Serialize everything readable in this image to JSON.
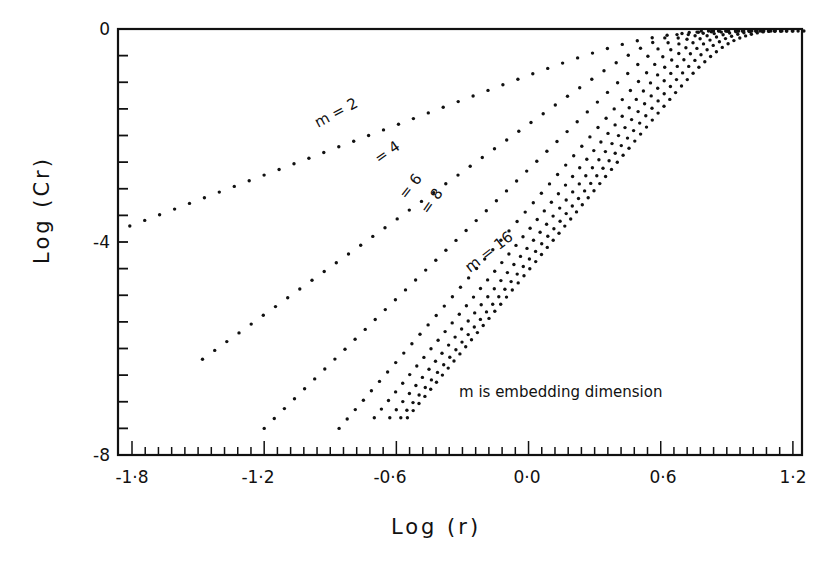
{
  "chart_data": {
    "type": "scatter",
    "title": "",
    "xlabel": "Log (r)",
    "ylabel": "Log (Cr)",
    "xlim": [
      -1.87,
      1.25
    ],
    "ylim": [
      -8,
      0
    ],
    "x_ticks": [
      "-1·8",
      "-1·2",
      "-0·6",
      "0·0",
      "0·6",
      "1·2"
    ],
    "x_tick_values": [
      -1.8,
      -1.2,
      -0.6,
      0.0,
      0.6,
      1.2
    ],
    "y_ticks": [
      "0",
      "-4",
      "-8"
    ],
    "y_tick_values": [
      0,
      -4,
      -8
    ],
    "grid": false,
    "legend": null,
    "annotation": "m is embedding dimension",
    "series": [
      {
        "name": "m = 2",
        "label": "m = 2",
        "x_start": -1.81,
        "y_start": -3.7,
        "x_end": 0.55,
        "y_end": 0.0,
        "bend": 0.25
      },
      {
        "name": "m = 4",
        "label": "= 4",
        "x_start": -1.48,
        "y_start": -6.2,
        "x_end": 0.6,
        "y_end": 0.0,
        "bend": 0.28
      },
      {
        "name": "m = 6",
        "label": "= 6",
        "x_start": -1.2,
        "y_start": -7.5,
        "x_end": 0.65,
        "y_end": 0.0,
        "bend": 0.32
      },
      {
        "name": "m = 8",
        "label": "= 8",
        "x_start": -0.86,
        "y_start": -7.5,
        "x_end": 0.7,
        "y_end": 0.0,
        "bend": 0.34
      },
      {
        "name": "m = 10",
        "label": "",
        "x_start": -0.7,
        "y_start": -7.3,
        "x_end": 0.75,
        "y_end": 0.0,
        "bend": 0.36
      },
      {
        "name": "m = 12",
        "label": "",
        "x_start": -0.63,
        "y_start": -7.3,
        "x_end": 0.8,
        "y_end": 0.0,
        "bend": 0.38
      },
      {
        "name": "m = 14",
        "label": "",
        "x_start": -0.58,
        "y_start": -7.3,
        "x_end": 0.85,
        "y_end": 0.0,
        "bend": 0.4
      },
      {
        "name": "m = 16",
        "label": "m = 16",
        "x_start": -0.55,
        "y_start": -7.3,
        "x_end": 0.9,
        "y_end": 0.0,
        "bend": 0.42
      }
    ]
  },
  "labels": {
    "x_axis_title": "Log (r)",
    "y_axis_title": "Log (Cr)",
    "annotation": "m is embedding dimension",
    "m2": "m = 2",
    "m4": "= 4",
    "m6": "= 6",
    "m8": "= 8",
    "m16": "m = 16",
    "y0": "0",
    "y4": "-4",
    "y8": "-8",
    "x1": "-1·8",
    "x2": "-1·2",
    "x3": "-0·6",
    "x4": "0·0",
    "x5": "0·6",
    "x6": "1·2"
  }
}
